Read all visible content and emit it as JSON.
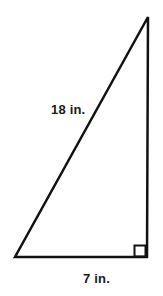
{
  "figure": {
    "name": "right-triangle-diagram",
    "shape": "right triangle",
    "background_color": "#ffffff",
    "stroke_color": "#111111",
    "stroke_width": 2.5,
    "text_color": "#1a1a1a",
    "vertices": {
      "apex": {
        "x": 148,
        "y": 17
      },
      "bottom_left": {
        "x": 15,
        "y": 257
      },
      "bottom_right": {
        "x": 147,
        "y": 257
      }
    },
    "right_angle_marker": {
      "name": "right-angle-marker",
      "at_vertex": "bottom_right",
      "x": 134,
      "y": 245,
      "size": 12
    },
    "labels": {
      "hypotenuse": "18 in.",
      "base": "7 in."
    }
  }
}
